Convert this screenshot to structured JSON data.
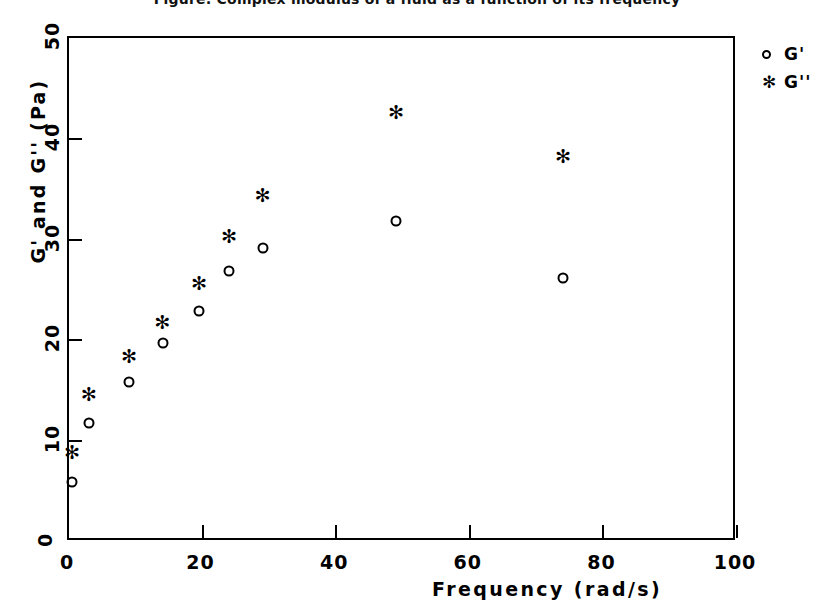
{
  "chart_data": {
    "type": "scatter",
    "title": "Figure: Complex modulus of a fluid as a function of its frequency",
    "xlabel": "Frequency (rad/s)",
    "ylabel": "G' and G'' (Pa)",
    "xlim": [
      0,
      100
    ],
    "ylim": [
      0,
      50
    ],
    "xticks": [
      0,
      20,
      40,
      60,
      80,
      100
    ],
    "yticks": [
      0,
      10,
      20,
      30,
      40,
      50
    ],
    "xtick_labels": [
      "0",
      "20",
      "40",
      "60",
      "80",
      "100"
    ],
    "ytick_labels": [
      "0",
      "10",
      "20",
      "30",
      "40",
      "50"
    ],
    "grid": false,
    "legend_position": "outside-right-top",
    "series": [
      {
        "name": "G'",
        "marker": "open-circle",
        "color": "#000000",
        "x": [
          0.5,
          3.0,
          9.0,
          14.0,
          19.5,
          24.0,
          29.0,
          49.0,
          74.0
        ],
        "y": [
          6.0,
          11.8,
          15.9,
          19.7,
          22.9,
          26.9,
          29.2,
          31.8,
          26.2
        ]
      },
      {
        "name": "G''",
        "marker": "asterisk",
        "color": "#000000",
        "x": [
          0.5,
          3.0,
          9.0,
          14.0,
          19.5,
          24.0,
          29.0,
          49.0,
          74.0
        ],
        "y": [
          8.7,
          14.5,
          18.3,
          21.6,
          25.5,
          30.2,
          34.2,
          42.5,
          38.1
        ]
      }
    ]
  },
  "legend": {
    "items": [
      {
        "label": "G'",
        "symbol": "open-circle"
      },
      {
        "label": "G''",
        "symbol": "asterisk"
      }
    ]
  },
  "symbols": {
    "asterisk": "✻"
  }
}
